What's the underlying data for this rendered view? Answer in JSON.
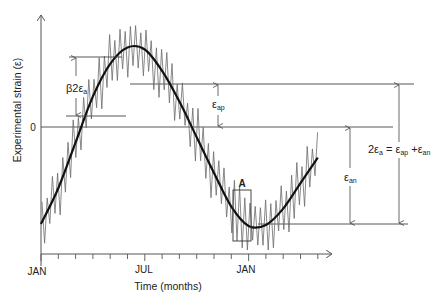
{
  "chart_data": {
    "type": "line",
    "title": "",
    "xlabel": "Time (months)",
    "ylabel": "Experimental strain (ε)",
    "x_tick_labels": [
      {
        "label": "JAN",
        "month_index": 0
      },
      {
        "label": "JUL",
        "month_index": 6
      },
      {
        "label": "JAN",
        "month_index": 12
      }
    ],
    "x_tick_count": 17,
    "y_tick_labels": [
      {
        "label": "0",
        "value": 0
      }
    ],
    "grid": false,
    "legend": null,
    "series": [
      {
        "name": "Smooth annual strain cycle",
        "style": "thick black",
        "x_months": [
          0,
          1,
          2,
          3,
          4,
          5,
          6,
          7,
          8,
          9,
          10,
          11,
          12,
          13,
          14,
          15,
          16
        ],
        "values_relative": [
          -0.95,
          -0.6,
          -0.15,
          0.3,
          0.62,
          0.78,
          0.76,
          0.55,
          0.25,
          -0.1,
          -0.45,
          -0.78,
          -0.97,
          -0.96,
          -0.8,
          -0.55,
          -0.3
        ]
      },
      {
        "name": "Experimental strain with daily fluctuations",
        "style": "thin grey zigzag",
        "description": "High-frequency oscillation superimposed on the smooth curve, amplitude ≈ β·2εa"
      }
    ],
    "annotations": [
      {
        "id": "beta-amplitude",
        "text": "β2εa",
        "meaning": "daily fluctuation range"
      },
      {
        "id": "eps-ap",
        "text": "εap",
        "meaning": "positive amplitude (zero to peak)"
      },
      {
        "id": "eps-an",
        "text": "εan",
        "meaning": "negative amplitude (zero to trough)"
      },
      {
        "id": "total-amplitude",
        "text": "2εa = εap + εan",
        "meaning": "total annual range"
      },
      {
        "id": "box-a",
        "text": "A",
        "meaning": "highlighted detail region near January minimum"
      }
    ]
  },
  "labels": {
    "y_axis_title": "Experimental strain (ε)",
    "x_axis_title": "Time (months)",
    "zero": "0",
    "x_jan_1": "JAN",
    "x_jul": "JUL",
    "x_jan_2": "JAN",
    "beta_prefix": "β2ε",
    "beta_sub": "a",
    "eps": "ε",
    "ap_sub": "ap",
    "an_sub": "an",
    "two_eps": "2ε",
    "a_sub": "a",
    "equals": " = ",
    "plus": " +",
    "box_a": "A"
  },
  "colors": {
    "axis": "#555555",
    "smooth_curve": "#111111",
    "noise": "#6b6b6b",
    "guide_lines": "#444444",
    "text": "#222222"
  }
}
